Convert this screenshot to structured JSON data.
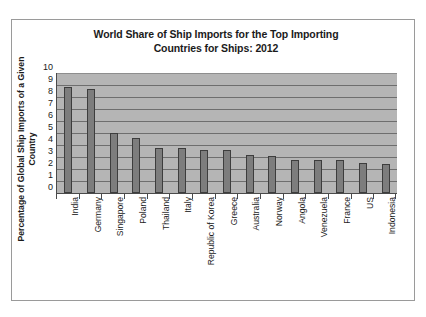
{
  "chart_data": {
    "type": "bar",
    "title": "World Share of Ship Imports for the Top Importing Countries for Ships: 2012",
    "title_line1": "World Share of Ship Imports for the Top Importing",
    "title_line2": "Countries for Ships: 2012",
    "xlabel": "",
    "ylabel": "Percentage of Global Ship Imports of a Given Country",
    "ylim": [
      0,
      10
    ],
    "ytick_labels": [
      "10",
      "9",
      "8",
      "7",
      "6",
      "5",
      "4",
      "3",
      "2",
      "1",
      "0"
    ],
    "ytick_values": [
      10,
      9,
      8,
      7,
      6,
      5,
      4,
      3,
      2,
      1,
      0
    ],
    "grid": true,
    "legend": false,
    "legend_position": "none",
    "categories": [
      "India",
      "Germany",
      "Singapore",
      "Poland",
      "Thailand",
      "Italy",
      "Republic of Korea",
      "Greece",
      "Australia",
      "Norway",
      "Angola",
      "Venezuela",
      "France",
      "US",
      "Indonesia"
    ],
    "values": [
      8.85,
      8.65,
      5.0,
      4.6,
      3.75,
      3.75,
      3.6,
      3.6,
      3.15,
      3.05,
      2.75,
      2.75,
      2.75,
      2.5,
      2.45
    ],
    "colors": {
      "bar_fill": "#7d7d7d",
      "bar_stroke": "#3d3d3d",
      "plot_background": "#b5b5b5",
      "gridline": "#6e6e6e",
      "axis": "#4a4a4a",
      "text": "#1b1b1b",
      "frame_border": "#9a9a9a",
      "page_background": "#ffffff"
    }
  }
}
